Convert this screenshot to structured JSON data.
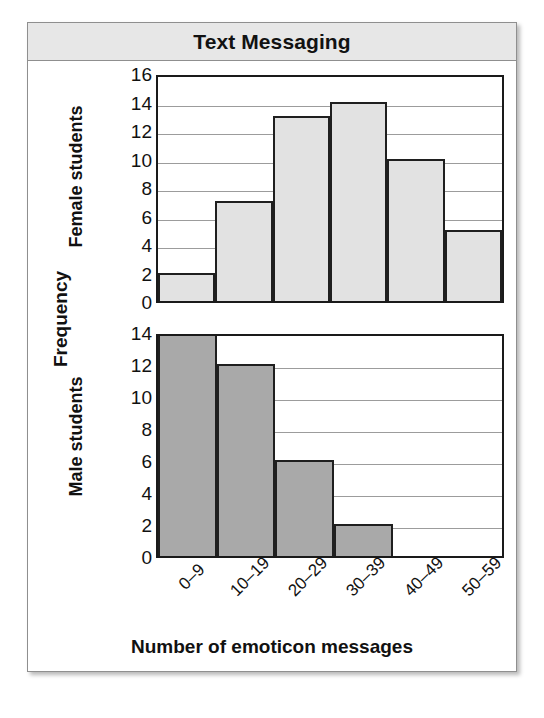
{
  "figure": {
    "title": "Text Messaging",
    "y_axis_title": "Frequency",
    "x_axis_title": "Number of emoticon messages"
  },
  "chart_data": {
    "type": "bar",
    "title": "Text Messaging",
    "xlabel": "Number of emoticon messages",
    "ylabel": "Frequency",
    "grid": true,
    "legend": "none",
    "categories": [
      "0–9",
      "10–19",
      "20–29",
      "30–39",
      "40–49",
      "50–59"
    ],
    "panels": [
      {
        "name": "Female students",
        "label": "Female students",
        "values": [
          2,
          7,
          13,
          14,
          10,
          5
        ],
        "ylim": [
          0,
          16
        ],
        "yticks": [
          0,
          2,
          4,
          6,
          8,
          10,
          12,
          14,
          16
        ],
        "bar_color": "#e2e2e2",
        "bar_edge_color": "#1f1f1f"
      },
      {
        "name": "Male students",
        "label": "Male students",
        "values": [
          14,
          12,
          6,
          2,
          0,
          0
        ],
        "ylim": [
          0,
          14
        ],
        "yticks": [
          0,
          2,
          4,
          6,
          8,
          10,
          12,
          14
        ],
        "bar_color": "#a9a9a9",
        "bar_edge_color": "#1f1f1f"
      }
    ]
  }
}
